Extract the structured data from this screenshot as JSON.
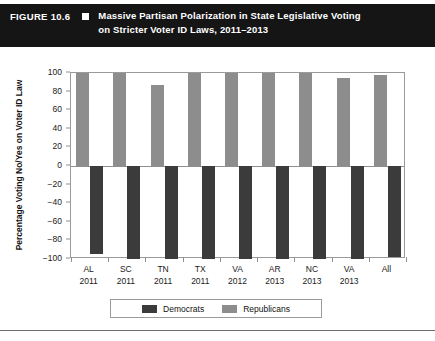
{
  "header": {
    "figure_number": "FIGURE 10.6",
    "marker_icon": "filled-square-icon",
    "title_line1": "Massive Partisan Polarization in State Legislative Voting",
    "title_line2": "on Stricter Voter ID Laws, 2011–2013",
    "background_color": "#151515",
    "text_color": "#ffffff"
  },
  "legend": {
    "items": [
      {
        "label": "Democrats",
        "color": "#3b3b3b"
      },
      {
        "label": "Republicans",
        "color": "#8d8d8d"
      }
    ]
  },
  "chart_data": {
    "type": "bar",
    "title": "Massive Partisan Polarization in State Legislative Voting on Stricter Voter ID Laws, 2011–2013",
    "xlabel": "",
    "ylabel": "Percentage Voting No/Yes on Voter ID Law",
    "ylim": [
      -100,
      100
    ],
    "yticks": [
      100,
      80,
      60,
      40,
      20,
      0,
      -20,
      -40,
      -60,
      -80,
      -100
    ],
    "ytick_labels": [
      "100",
      "80",
      "60",
      "40",
      "20",
      "0",
      "−20",
      "−40",
      "−60",
      "−80",
      "−100"
    ],
    "grid": false,
    "legend_position": "bottom",
    "categories": [
      "AL",
      "SC",
      "TN",
      "TX",
      "VA",
      "AR",
      "NC",
      "VA",
      "All"
    ],
    "category_years": [
      "2011",
      "2011",
      "2011",
      "2011",
      "2012",
      "2013",
      "2013",
      "2013",
      ""
    ],
    "series": [
      {
        "name": "Democrats",
        "color": "#3b3b3b",
        "values": [
          -95,
          -100,
          -100,
          -100,
          -100,
          -100,
          -100,
          -100,
          -98
        ]
      },
      {
        "name": "Republicans",
        "color": "#8d8d8d",
        "values": [
          100,
          100,
          87,
          100,
          100,
          100,
          100,
          95,
          98
        ]
      }
    ]
  }
}
